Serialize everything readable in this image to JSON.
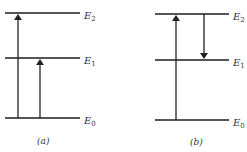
{
  "diagram": {
    "type": "energy-level-diagram",
    "panels": [
      {
        "caption": "(a)",
        "levels": [
          {
            "label": "E",
            "sub": "2"
          },
          {
            "label": "E",
            "sub": "1"
          },
          {
            "label": "E",
            "sub": "0"
          }
        ],
        "transitions": [
          {
            "from": "E0",
            "to": "E2",
            "direction": "up"
          },
          {
            "from": "E0",
            "to": "E1",
            "direction": "up"
          }
        ]
      },
      {
        "caption": "(b)",
        "levels": [
          {
            "label": "E",
            "sub": "2"
          },
          {
            "label": "E",
            "sub": "1"
          },
          {
            "label": "E",
            "sub": "0"
          }
        ],
        "transitions": [
          {
            "from": "E0",
            "to": "E2",
            "direction": "up"
          },
          {
            "from": "E2",
            "to": "E1",
            "direction": "down"
          }
        ]
      }
    ],
    "colors": {
      "line": "#555555",
      "arrow": "#222222"
    }
  }
}
